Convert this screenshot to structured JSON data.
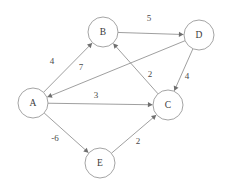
{
  "diagram": {
    "type": "directed-weighted-graph",
    "background_color": "#ffffff",
    "stroke_color": "#8e8e8e",
    "text_color": "#3a3a3a",
    "node_radius": 15,
    "nodes": [
      {
        "id": "A",
        "label": "A",
        "x": 33,
        "y": 103
      },
      {
        "id": "B",
        "label": "B",
        "x": 103,
        "y": 32
      },
      {
        "id": "C",
        "label": "C",
        "x": 168,
        "y": 105
      },
      {
        "id": "D",
        "label": "D",
        "x": 199,
        "y": 35
      },
      {
        "id": "E",
        "label": "E",
        "x": 100,
        "y": 163
      }
    ],
    "edges": [
      {
        "from": "A",
        "to": "B",
        "weight": "4",
        "label_x": 52,
        "label_y": 62
      },
      {
        "from": "D",
        "to": "A",
        "weight": "7",
        "label_x": 81,
        "label_y": 68
      },
      {
        "from": "B",
        "to": "D",
        "weight": "5",
        "label_x": 149,
        "label_y": 19
      },
      {
        "from": "C",
        "to": "B",
        "weight": "2",
        "label_x": 150,
        "label_y": 75
      },
      {
        "from": "D",
        "to": "C",
        "weight": "4",
        "label_x": 187,
        "label_y": 77
      },
      {
        "from": "A",
        "to": "C",
        "weight": "3",
        "label_x": 96,
        "label_y": 96
      },
      {
        "from": "A",
        "to": "E",
        "weight": "-6",
        "label_x": 55,
        "label_y": 139
      },
      {
        "from": "E",
        "to": "C",
        "weight": "2",
        "label_x": 138,
        "label_y": 142
      }
    ]
  }
}
